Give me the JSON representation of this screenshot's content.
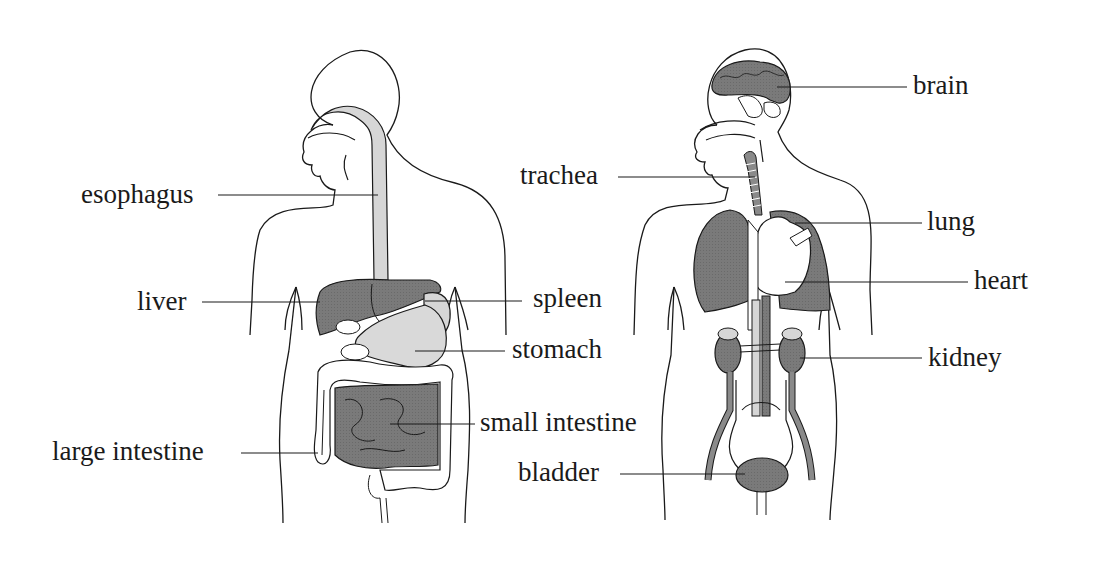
{
  "figures": [
    {
      "id": "digestive-system",
      "labels": [
        {
          "key": "esophagus",
          "text": "esophagus"
        },
        {
          "key": "liver",
          "text": "liver"
        },
        {
          "key": "spleen",
          "text": "spleen"
        },
        {
          "key": "stomach",
          "text": "stomach"
        },
        {
          "key": "small_intestine",
          "text": "small intestine"
        },
        {
          "key": "large_intestine",
          "text": "large intestine"
        }
      ]
    },
    {
      "id": "organ-systems",
      "labels": [
        {
          "key": "brain",
          "text": "brain"
        },
        {
          "key": "trachea",
          "text": "trachea"
        },
        {
          "key": "lung",
          "text": "lung"
        },
        {
          "key": "heart",
          "text": "heart"
        },
        {
          "key": "kidney",
          "text": "kidney"
        },
        {
          "key": "bladder",
          "text": "bladder"
        }
      ]
    }
  ],
  "colors": {
    "outline": "#1a1a1a",
    "organ_dark": "#7a7a7a",
    "organ_light": "#d6d6d6",
    "background": "#ffffff"
  }
}
